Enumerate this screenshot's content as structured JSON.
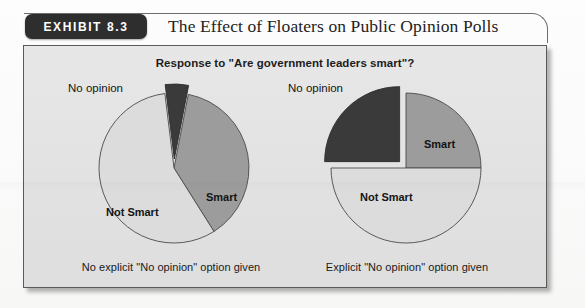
{
  "header": {
    "badge_label": "EXHIBIT 8.3",
    "title": "The Effect of Floaters on Public Opinion Polls"
  },
  "panel": {
    "subtitle": "Response to \"Are government leaders smart\"?"
  },
  "colors": {
    "smart": "#9c9c9c",
    "not_smart": "#dcdcdc",
    "no_opinion": "#3a3a3a",
    "outline": "#4a4a4a",
    "panel_bg": "#e4e4e4",
    "badge_bg": "#2e2e2e",
    "text": "#1a1a1a"
  },
  "chart_data": [
    {
      "type": "pie",
      "id": "left-pie",
      "title": "Response to \"Are government leaders smart\"?",
      "caption": "No explicit \"No opinion\" option given",
      "categories": [
        "Smart",
        "Not Smart",
        "No opinion"
      ],
      "values": [
        38,
        57,
        5
      ],
      "labels_inside": [
        "Smart",
        "Not Smart"
      ],
      "labels_outside": [
        "No opinion"
      ],
      "exploded": [
        "No opinion"
      ],
      "legend": "none",
      "slice_labels": {
        "smart": "Smart",
        "not_smart": "Not Smart",
        "no_opinion": "No opinion"
      }
    },
    {
      "type": "pie",
      "id": "right-pie",
      "title": "Response to \"Are government leaders smart\"?",
      "caption": "Explicit \"No opinion\" option given",
      "categories": [
        "Smart",
        "Not Smart",
        "No opinion"
      ],
      "values": [
        25,
        50,
        25
      ],
      "labels_inside": [
        "Smart",
        "Not Smart"
      ],
      "labels_outside": [
        "No opinion"
      ],
      "exploded": [
        "No opinion"
      ],
      "legend": "none",
      "slice_labels": {
        "smart": "Smart",
        "not_smart": "Not Smart",
        "no_opinion": "No opinion"
      }
    }
  ]
}
